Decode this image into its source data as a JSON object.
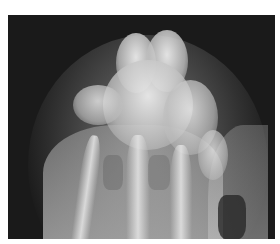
{
  "image": {
    "type": "radiograph",
    "description": "X-ray of a bony structure with overlapping bones in grayscale on a dark background",
    "colors": {
      "background": "#1a1a1a",
      "bone": "#e0e0e0",
      "soft_tissue": "#9a9a9a",
      "border": "#ffffff"
    }
  }
}
